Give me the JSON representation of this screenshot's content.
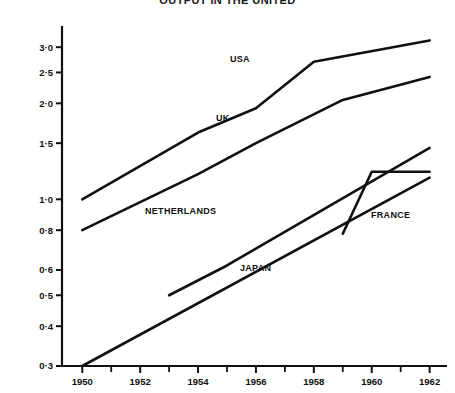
{
  "chart_data": {
    "type": "line",
    "title": "OUTPUT IN THE UNITED",
    "xlabel": "",
    "ylabel": "",
    "x_tick_labels": [
      "1950",
      "1952",
      "1954",
      "1956",
      "1958",
      "1960",
      "1962"
    ],
    "x_ticks": [
      1950,
      1952,
      1954,
      1956,
      1958,
      1960,
      1962
    ],
    "x_minor_ticks": [
      1951,
      1953,
      1955,
      1957,
      1959,
      1961
    ],
    "xlim": [
      1949.3,
      1962.6
    ],
    "y_scale": "log",
    "y_tick_labels": [
      "3·0",
      "2·5",
      "2·0",
      "1·5",
      "1·0",
      "0·8",
      "0·6",
      "0·5",
      "0·4",
      "0·3"
    ],
    "y_ticks": [
      3.0,
      2.5,
      2.0,
      1.5,
      1.0,
      0.8,
      0.6,
      0.5,
      0.4,
      0.3
    ],
    "ylim": [
      0.3,
      3.3
    ],
    "grid": false,
    "legend": "inline-labels",
    "line_color": "#101010",
    "series": [
      {
        "name": "USA",
        "label": "USA",
        "x": [
          1950,
          1954,
          1956,
          1958,
          1962
        ],
        "values": [
          1.0,
          1.62,
          1.93,
          2.7,
          3.15
        ]
      },
      {
        "name": "UK",
        "label": "UK",
        "x": [
          1950,
          1954,
          1956,
          1959,
          1962
        ],
        "values": [
          0.8,
          1.2,
          1.5,
          2.05,
          2.42
        ]
      },
      {
        "name": "NETHERLANDS",
        "label": "NETHERLANDS",
        "x": [
          1953,
          1955,
          1962
        ],
        "values": [
          0.5,
          0.62,
          1.45
        ]
      },
      {
        "name": "FRANCE",
        "label": "FRANCE",
        "x": [
          1959,
          1960,
          1962
        ],
        "values": [
          0.78,
          1.22,
          1.22
        ]
      },
      {
        "name": "JAPAN",
        "label": "JAPAN",
        "x": [
          1950,
          1962
        ],
        "values": [
          0.3,
          1.17
        ]
      }
    ]
  }
}
